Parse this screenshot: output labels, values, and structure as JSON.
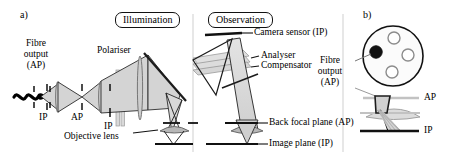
{
  "figure": {
    "panels": [
      {
        "tag": "a)",
        "name": "microscope-schematic"
      },
      {
        "tag": "b)",
        "name": "fibre-bundle-detail"
      }
    ],
    "boxed_titles": [
      {
        "label": "Illumination",
        "name": "illumination-title"
      },
      {
        "label": "Observation",
        "name": "observation-title"
      }
    ],
    "labels_panel_a": {
      "fibre_output": "Fibre\noutput\n(AP)",
      "fibre_output_line1": "Fibre",
      "fibre_output_line2": "output",
      "fibre_output_line3": "(AP)",
      "polariser": "Polariser",
      "objective_lens": "Objective lens",
      "camera_sensor": "Camera sensor (IP)",
      "analyser": "Analyser",
      "compensator": "Compensator",
      "back_focal_plane": "Back focal plane (AP)",
      "image_plane": "Image plane (IP)",
      "plane_markers": [
        {
          "text": "IP",
          "name": "plane-marker-ip-1"
        },
        {
          "text": "AP",
          "name": "plane-marker-ap-1"
        },
        {
          "text": "IP",
          "name": "plane-marker-ip-2"
        }
      ]
    },
    "labels_panel_b": {
      "fibre_output_line1": "Fibre",
      "fibre_output_line2": "output",
      "fibre_output_line3": "(AP)",
      "ap": "AP",
      "ip": "IP"
    },
    "colors": {
      "ink": "#000000",
      "beam_fill": "#d8d8d8",
      "beam_fill_light": "#e8e8e8",
      "optic_fill": "#c9c9c9",
      "optic_stroke": "#6f6f6f",
      "lens_fill": "#b9b9b9",
      "guide_grey": "#b5b5b5"
    }
  }
}
